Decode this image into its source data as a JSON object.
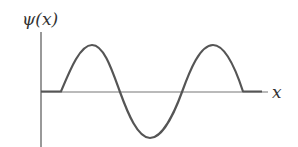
{
  "diagram": {
    "y_label": "ψ(x)",
    "x_label": "x",
    "colors": {
      "axis": "#555555",
      "wave": "#555555",
      "text": "#333333"
    },
    "wave": {
      "description": "Wavefunction: flat zero segment, then one and a half sine periods (peak, trough, peak), then flat zero segment",
      "segments": [
        "flat",
        "peak",
        "trough",
        "peak",
        "flat"
      ]
    }
  }
}
